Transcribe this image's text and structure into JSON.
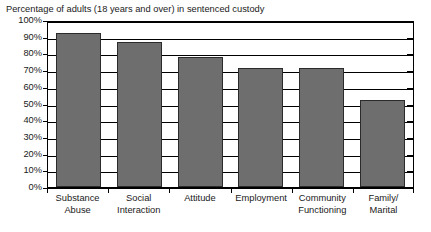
{
  "chart_data": {
    "type": "bar",
    "title": "Percentage of adults (18 years and over) in sentenced custody",
    "xlabel": "",
    "ylabel": "",
    "ylim": [
      0,
      100
    ],
    "grid": true,
    "legend": "none",
    "categories": [
      "Substance Abuse",
      "Social Interaction",
      "Attitude",
      "Employment",
      "Community Functioning",
      "Family/ Marital"
    ],
    "category_lines": [
      [
        "Substance",
        "Abuse"
      ],
      [
        "Social",
        "Interaction"
      ],
      [
        "Attitude",
        ""
      ],
      [
        "Employment",
        ""
      ],
      [
        "Community",
        "Functioning"
      ],
      [
        "Family/",
        "Marital"
      ]
    ],
    "values": [
      92,
      87,
      78,
      71,
      71,
      52
    ],
    "ytick_labels": [
      "100%",
      "90%",
      "80%",
      "70%",
      "60%",
      "50%",
      "40%",
      "30%",
      "20%",
      "10%",
      "0%"
    ],
    "ytick_values": [
      100,
      90,
      80,
      70,
      60,
      50,
      40,
      30,
      20,
      10,
      0
    ],
    "bar_color": "#6e6e6e",
    "bar_border_color": "#2b2b2b",
    "axis_color": "#000000",
    "background_color": "#ffffff"
  }
}
